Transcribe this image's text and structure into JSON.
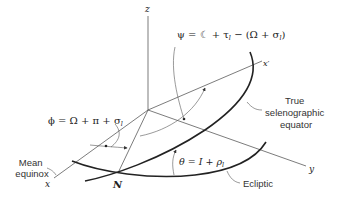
{
  "diagram": {
    "axes": {
      "z": "z",
      "x": "x",
      "x_prime": "x′",
      "y": "y"
    },
    "points": {
      "node": "N"
    },
    "equations": {
      "psi": "ψ = ☾ + τ",
      "psi_sub": "l",
      "psi_rest": " − (Ω + σ",
      "psi_sub2": "l",
      "psi_end": ")",
      "phi": "ϕ = Ω + π + σ",
      "phi_sub": "l",
      "theta": "θ = I + ρ",
      "theta_sub": "l"
    },
    "labels": {
      "true_equator_line1": "True",
      "true_equator_line2": "selenographic",
      "true_equator_line3": "equator",
      "mean_equinox_line1": "Mean",
      "mean_equinox_line2": "equinox",
      "ecliptic": "Ecliptic"
    }
  }
}
